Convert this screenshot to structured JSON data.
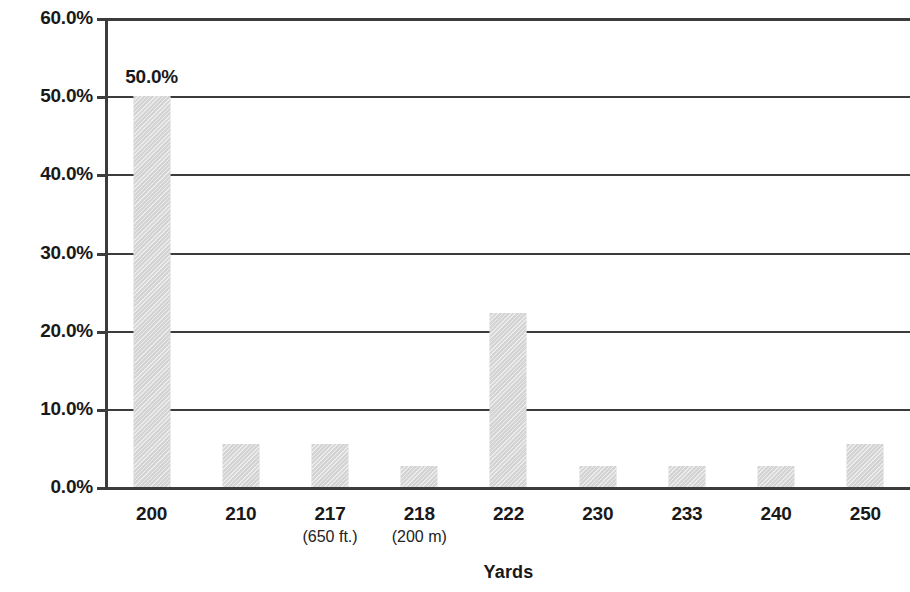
{
  "chart_data": {
    "type": "bar",
    "title": "",
    "subtitle": "",
    "xlabel": "Yards",
    "ylabel": "",
    "categories": [
      "200",
      "210",
      "217",
      "218",
      "222",
      "230",
      "233",
      "240",
      "250"
    ],
    "category_sublabels": [
      "",
      "",
      "(650 ft.)",
      "(200 m)",
      "",
      "",
      "",
      "",
      ""
    ],
    "values": [
      50.0,
      5.5,
      5.5,
      2.7,
      22.2,
      2.7,
      2.7,
      2.7,
      5.5
    ],
    "value_labels": [
      "50.0%",
      "",
      "",
      "",
      "",
      "",
      "",
      "",
      ""
    ],
    "ylim": [
      0,
      60
    ],
    "ytick_values": [
      0,
      10,
      20,
      30,
      40,
      50,
      60
    ],
    "ytick_labels": [
      "0.0%",
      "10.0%",
      "20.0%",
      "30.0%",
      "40.0%",
      "50.0%",
      "60.0%"
    ],
    "grid": true,
    "grid_axis": "y",
    "legend": false,
    "legend_position": "none",
    "bar_color": "#d4d4d4",
    "axis_color": "#3c3c3c",
    "text_color": "#191919"
  }
}
